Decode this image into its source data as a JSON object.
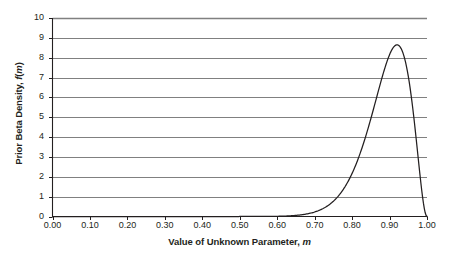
{
  "chart_data": {
    "type": "line",
    "title": "",
    "xlabel_parts": {
      "main": "Value of Unknown Parameter,",
      "italic": "m"
    },
    "ylabel_parts": {
      "main": "Prior Beta Density,",
      "italic_f": "f",
      "paren_open": "(",
      "italic_m": "m",
      "paren_close": ")"
    },
    "xlabel": "Value of Unknown Parameter, m",
    "ylabel": "Prior Beta Density, f(m)",
    "xlim": [
      0.0,
      1.0
    ],
    "ylim": [
      0,
      10
    ],
    "xticks": [
      0.0,
      0.1,
      0.2,
      0.3,
      0.4,
      0.5,
      0.6,
      0.7,
      0.8,
      0.9,
      1.0
    ],
    "xticklabels": [
      "0.00",
      "0.10",
      "0.20",
      "0.30",
      "0.40",
      "0.50",
      "0.60",
      "0.70",
      "0.80",
      "0.90",
      "1.00"
    ],
    "yticks": [
      0,
      1,
      2,
      3,
      4,
      5,
      6,
      7,
      8,
      9,
      10
    ],
    "yticklabels": [
      "0",
      "1",
      "2",
      "3",
      "4",
      "5",
      "6",
      "7",
      "8",
      "9",
      "10"
    ],
    "grid": "horizontal",
    "legend": "none",
    "series": [
      {
        "name": "Prior Beta Density",
        "distribution": "Beta",
        "alpha": 24,
        "beta": 3,
        "peak_x": 0.92,
        "peak_y": 8.65,
        "x": [
          0.0,
          0.05,
          0.1,
          0.15,
          0.2,
          0.25,
          0.3,
          0.35,
          0.4,
          0.45,
          0.5,
          0.55,
          0.58,
          0.6,
          0.62,
          0.64,
          0.66,
          0.68,
          0.7,
          0.72,
          0.74,
          0.76,
          0.78,
          0.8,
          0.82,
          0.84,
          0.86,
          0.88,
          0.9,
          0.91,
          0.92,
          0.93,
          0.94,
          0.95,
          0.96,
          0.97,
          0.98,
          0.99,
          1.0
        ],
        "y": [
          0.0,
          0.0,
          0.0,
          0.0,
          0.0,
          0.0,
          0.0,
          0.0,
          0.001,
          0.003,
          0.012,
          0.041,
          0.069,
          0.095,
          0.13,
          0.175,
          0.234,
          0.31,
          0.406,
          0.527,
          0.679,
          0.866,
          1.094,
          1.37,
          1.698,
          2.084,
          2.528,
          3.024,
          3.558,
          7.6,
          8.65,
          8.61,
          7.9,
          6.6,
          4.9,
          3.0,
          1.35,
          0.33,
          0.0
        ]
      }
    ],
    "colors": {
      "curve": "#231f20",
      "grid": "#808080",
      "axis": "#231f20",
      "background": "#ffffff",
      "text": "#231f20"
    }
  }
}
